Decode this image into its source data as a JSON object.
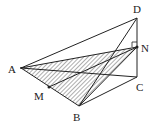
{
  "diagram": {
    "type": "geometry-3d-tetrahedron",
    "points": {
      "A": {
        "label": "A",
        "x": 21,
        "y": 68
      },
      "B": {
        "label": "B",
        "x": 79,
        "y": 106
      },
      "C": {
        "label": "C",
        "x": 137,
        "y": 77
      },
      "D": {
        "label": "D",
        "x": 137,
        "y": 18
      },
      "N": {
        "label": "N",
        "x": 137,
        "y": 47
      },
      "M": {
        "label": "M",
        "x": 49,
        "y": 87
      }
    },
    "segments": [
      "AD",
      "AC",
      "AB",
      "BC",
      "BD",
      "DC",
      "AN",
      "BN",
      "MN"
    ],
    "shaded_region": [
      "A",
      "B",
      "N"
    ],
    "right_angle_mark_at": "N",
    "colors": {
      "stroke": "#222222",
      "hatch": "#333333",
      "background": "#ffffff"
    }
  }
}
